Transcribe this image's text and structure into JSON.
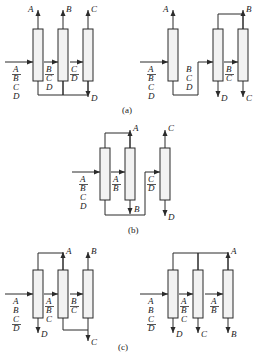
{
  "figure": {
    "type": "process-flow-diagram",
    "stroke_color": "#2b2b2b",
    "column_fill": "#f2f2f2",
    "background": "#ffffff",
    "captions": [
      {
        "id": "a",
        "label": "(a)"
      },
      {
        "id": "b",
        "label": "(b)"
      },
      {
        "id": "c",
        "label": "(c)"
      }
    ]
  },
  "labels": {
    "A": "A",
    "B": "B",
    "C": "C",
    "D": "D",
    "feed_ABCD": [
      "A",
      "B",
      "C",
      "D"
    ],
    "feed_BCD": [
      "B",
      "C",
      "D"
    ],
    "feed_ABC": [
      "A",
      "B",
      "C"
    ],
    "feed_CD": [
      "C",
      "D"
    ],
    "feed_BC": [
      "B",
      "C"
    ],
    "feed_AB": [
      "A",
      "B"
    ]
  },
  "panels": [
    {
      "id": "a-left",
      "caption": "(a)",
      "description": "Direct sequence with bottoms transfer",
      "columns": [
        {
          "name": "col-1",
          "top_product": "A",
          "side_feed": [
            "A",
            "B",
            "C",
            "D"
          ],
          "bottom_to": "col-2"
        },
        {
          "name": "col-2",
          "top_product": "B",
          "side_feed": [
            "B",
            "C",
            "D"
          ],
          "bottom_to": "col-3"
        },
        {
          "name": "col-3",
          "top_product": "C",
          "side_feed": [
            "C",
            "D"
          ],
          "bottom_product": "D"
        }
      ]
    },
    {
      "id": "a-right",
      "caption": "(a)",
      "description": "Indirect/mixed sequence with overhead transfer",
      "columns": [
        {
          "name": "col-1",
          "top_product": "A",
          "side_feed": [
            "A",
            "B",
            "C",
            "D"
          ],
          "bottom_to": "col-2"
        },
        {
          "name": "col-2",
          "top_to": "col-3",
          "side_feed": [
            "B",
            "C",
            "D"
          ],
          "bottom_product": "D"
        },
        {
          "name": "col-3",
          "top_product": "B",
          "side_feed": [
            "B",
            "C"
          ],
          "bottom_product": "C"
        }
      ]
    },
    {
      "id": "b",
      "caption": "(b)",
      "description": "Prefractionator arrangement with top and bottom recycle",
      "columns": [
        {
          "name": "col-1",
          "top_to": "col-2",
          "side_feed": [
            "A",
            "B",
            "C",
            "D"
          ],
          "bottom_to": "col-3"
        },
        {
          "name": "col-2",
          "top_product": "A",
          "side_feed": [
            "A",
            "B"
          ],
          "bottom_product": "B"
        },
        {
          "name": "col-3",
          "top_product": "C",
          "side_feed": [
            "C",
            "D"
          ],
          "bottom_product": "D"
        }
      ]
    },
    {
      "id": "c-left",
      "caption": "(c)",
      "description": "Indirect sequence, bottoms D first",
      "columns": [
        {
          "name": "col-1",
          "top_to": "col-2",
          "side_feed": [
            "A",
            "B",
            "C",
            "D"
          ],
          "bottom_product": "D"
        },
        {
          "name": "col-2",
          "top_product": "A",
          "side_feed": [
            "A",
            "B",
            "C"
          ],
          "bottom_to": "col-3"
        },
        {
          "name": "col-3",
          "top_product": "B",
          "side_feed": [
            "B",
            "C"
          ],
          "bottom_product": "C"
        }
      ]
    },
    {
      "id": "c-right",
      "caption": "(c)",
      "description": "Fully indirect sequence, heavy products removed sequentially",
      "columns": [
        {
          "name": "col-1",
          "top_to": "col-2",
          "side_feed": [
            "A",
            "B",
            "C",
            "D"
          ],
          "bottom_product": "D"
        },
        {
          "name": "col-2",
          "top_to": "col-3",
          "side_feed": [
            "A",
            "B",
            "C"
          ],
          "bottom_product": "C"
        },
        {
          "name": "col-3",
          "top_product": "A",
          "side_feed": [
            "A",
            "B"
          ],
          "bottom_product": "B"
        }
      ]
    }
  ]
}
